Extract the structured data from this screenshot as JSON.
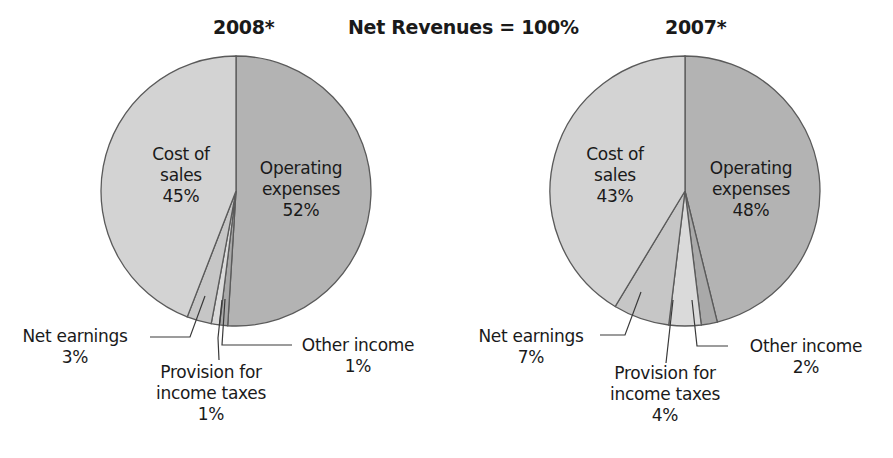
{
  "header": {
    "left_title": "2008*",
    "center_title": "Net Revenues = 100%",
    "right_title": "2007*"
  },
  "colors": {
    "cost_of_sales": "#d3d3d3",
    "operating_expenses": "#b3b3b3",
    "net_earnings": "#c6c6c6",
    "provision": "#dadada",
    "other_income": "#a9a9a9",
    "outline": "#5a5a5a"
  },
  "pies": [
    {
      "year": "2008*",
      "labels": {
        "cost_of_sales": [
          "Cost of",
          "sales",
          "45%"
        ],
        "operating_expenses": [
          "Operating",
          "expenses",
          "52%"
        ],
        "net_earnings": [
          "Net earnings",
          "3%"
        ],
        "provision": [
          "Provision for",
          "income taxes",
          "1%"
        ],
        "other_income": [
          "Other income",
          "1%"
        ]
      }
    },
    {
      "year": "2007*",
      "labels": {
        "cost_of_sales": [
          "Cost of",
          "sales",
          "43%"
        ],
        "operating_expenses": [
          "Operating",
          "expenses",
          "48%"
        ],
        "net_earnings": [
          "Net earnings",
          "7%"
        ],
        "provision": [
          "Provision for",
          "income taxes",
          "4%"
        ],
        "other_income": [
          "Other income",
          "2%"
        ]
      }
    }
  ],
  "chart_data": [
    {
      "type": "pie",
      "title": "2008*",
      "subtitle": "Net Revenues = 100%",
      "categories": [
        "Operating expenses",
        "Other income",
        "Provision for income taxes",
        "Net earnings",
        "Cost of sales"
      ],
      "values": [
        52,
        1,
        1,
        3,
        45
      ],
      "unit": "% of net revenues"
    },
    {
      "type": "pie",
      "title": "2007*",
      "subtitle": "Net Revenues = 100%",
      "categories": [
        "Operating expenses",
        "Other income",
        "Provision for income taxes",
        "Net earnings",
        "Cost of sales"
      ],
      "values": [
        48,
        2,
        4,
        7,
        43
      ],
      "unit": "% of net revenues"
    }
  ]
}
